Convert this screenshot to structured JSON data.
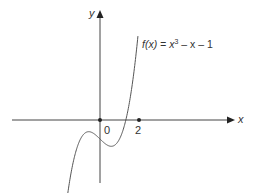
{
  "chart_data": {
    "type": "line",
    "title": "",
    "function_label": "f(x) = x^3 - x - 1",
    "function_label_parts": {
      "lhs": "f(x) = x",
      "exponent": "3",
      "rhs": " – x – 1"
    },
    "xlabel": "x",
    "ylabel": "y",
    "tick_labels": {
      "origin": "0",
      "x2": "2"
    },
    "x_ticks": [
      0,
      2
    ],
    "xlim": [
      -4.5,
      6.8
    ],
    "ylim": [
      -3.3,
      5.6
    ],
    "grid": false,
    "legend": "none",
    "series": [
      {
        "name": "f(x) = x^3 - x - 1",
        "x": [
          -1.6,
          -1.4,
          -1.2,
          -1.0,
          -0.8,
          -0.577,
          -0.4,
          -0.2,
          0,
          0.2,
          0.4,
          0.577,
          0.8,
          1.0,
          1.2,
          1.324,
          1.5,
          1.7,
          1.9,
          2.0
        ],
        "values": [
          -2.5,
          -1.34,
          -0.53,
          -1.0,
          -0.71,
          -0.615,
          -0.66,
          -0.81,
          -1.0,
          -1.19,
          -1.34,
          -1.385,
          -1.29,
          -1.0,
          -0.47,
          0.0,
          0.875,
          2.21,
          3.96,
          4.2
        ]
      }
    ],
    "color": "#333333"
  }
}
